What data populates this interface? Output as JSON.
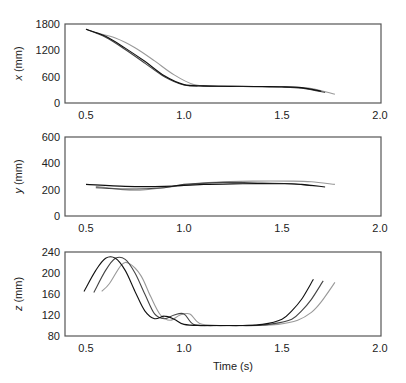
{
  "chart_data": [
    {
      "type": "line",
      "panel": "x",
      "ylabel_var": "x",
      "ylabel_unit": " (mm)",
      "xlabel": "",
      "xlim": [
        0.4,
        2.0
      ],
      "ylim": [
        0,
        1800
      ],
      "yticks": [
        0,
        600,
        1200,
        1800
      ],
      "xticks": [
        "0.5",
        "1.0",
        "1.5",
        "2.0"
      ],
      "grid": false,
      "series": [
        {
          "name": "trial 1",
          "color": "#111111",
          "x": [
            0.5,
            0.6,
            0.7,
            0.8,
            0.9,
            1.0,
            1.1,
            1.2,
            1.3,
            1.4,
            1.5,
            1.6,
            1.7
          ],
          "values": [
            1680,
            1520,
            1250,
            950,
            620,
            420,
            390,
            380,
            380,
            375,
            370,
            350,
            270
          ]
        },
        {
          "name": "trial 2",
          "color": "#444444",
          "x": [
            0.5,
            0.6,
            0.7,
            0.8,
            0.9,
            1.0,
            1.1,
            1.2,
            1.3,
            1.4,
            1.5,
            1.6,
            1.72
          ],
          "values": [
            1680,
            1500,
            1220,
            910,
            600,
            410,
            385,
            378,
            375,
            372,
            365,
            340,
            240
          ]
        },
        {
          "name": "trial 3",
          "color": "#999999",
          "x": [
            0.55,
            0.65,
            0.75,
            0.85,
            0.95,
            1.05,
            1.15,
            1.25,
            1.35,
            1.45,
            1.55,
            1.65,
            1.77
          ],
          "values": [
            1600,
            1480,
            1260,
            960,
            640,
            420,
            390,
            380,
            375,
            370,
            360,
            330,
            200
          ]
        }
      ]
    },
    {
      "type": "line",
      "panel": "y",
      "ylabel_var": "y",
      "ylabel_unit": " (mm)",
      "xlabel": "",
      "xlim": [
        0.4,
        2.0
      ],
      "ylim": [
        0,
        600
      ],
      "yticks": [
        0,
        200,
        400,
        600
      ],
      "xticks": [
        "0.5",
        "1.0",
        "1.5",
        "2.0"
      ],
      "grid": false,
      "series": [
        {
          "name": "trial 1",
          "color": "#111111",
          "x": [
            0.5,
            0.7,
            0.9,
            1.1,
            1.3,
            1.5,
            1.6,
            1.72
          ],
          "values": [
            240,
            225,
            225,
            240,
            245,
            245,
            240,
            220
          ]
        },
        {
          "name": "trial 2",
          "color": "#444444",
          "x": [
            0.55,
            0.7,
            0.9,
            1.0,
            1.2,
            1.4,
            1.55,
            1.65
          ],
          "values": [
            215,
            205,
            215,
            240,
            255,
            250,
            245,
            230
          ]
        },
        {
          "name": "trial 3",
          "color": "#999999",
          "x": [
            0.55,
            0.75,
            0.95,
            1.15,
            1.35,
            1.55,
            1.65,
            1.77
          ],
          "values": [
            225,
            195,
            225,
            255,
            265,
            265,
            260,
            240
          ]
        }
      ]
    },
    {
      "type": "line",
      "panel": "z",
      "ylabel_var": "z",
      "ylabel_unit": " (mm)",
      "xlabel": "Time (s)",
      "xlim": [
        0.4,
        2.0
      ],
      "ylim": [
        80,
        240
      ],
      "yticks": [
        80,
        120,
        160,
        200,
        240
      ],
      "xticks": [
        "0.5",
        "1.0",
        "1.5",
        "2.0"
      ],
      "grid": false,
      "series": [
        {
          "name": "trial 1",
          "color": "#111111",
          "x": [
            0.49,
            0.55,
            0.6,
            0.65,
            0.7,
            0.75,
            0.8,
            0.85,
            0.9,
            0.95,
            1.0,
            1.1,
            1.2,
            1.3,
            1.4,
            1.5,
            1.55,
            1.6,
            1.66
          ],
          "values": [
            165,
            205,
            228,
            228,
            205,
            165,
            128,
            113,
            118,
            112,
            102,
            100,
            100,
            100,
            102,
            112,
            128,
            150,
            188
          ]
        },
        {
          "name": "trial 2",
          "color": "#444444",
          "x": [
            0.54,
            0.6,
            0.65,
            0.7,
            0.75,
            0.8,
            0.85,
            0.9,
            0.95,
            1.0,
            1.05,
            1.15,
            1.25,
            1.35,
            1.45,
            1.55,
            1.6,
            1.65,
            1.71
          ],
          "values": [
            163,
            205,
            228,
            226,
            200,
            160,
            122,
            113,
            120,
            122,
            102,
            100,
            100,
            100,
            103,
            112,
            128,
            150,
            185
          ]
        },
        {
          "name": "trial 3",
          "color": "#999999",
          "x": [
            0.58,
            0.62,
            0.68,
            0.72,
            0.78,
            0.83,
            0.88,
            0.93,
            0.98,
            1.03,
            1.08,
            1.18,
            1.28,
            1.38,
            1.48,
            1.58,
            1.65,
            1.7,
            1.77
          ],
          "values": [
            165,
            180,
            215,
            218,
            195,
            155,
            120,
            110,
            120,
            122,
            104,
            100,
            100,
            100,
            102,
            110,
            125,
            145,
            182
          ]
        }
      ]
    }
  ],
  "labels": {
    "tick_0_5": "0.5",
    "tick_1_0": "1.0",
    "tick_1_5": "1.5",
    "tick_2_0": "2.0",
    "time_label": "Time (s)"
  }
}
